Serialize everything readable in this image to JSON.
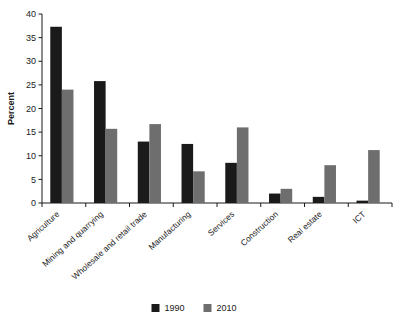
{
  "chart_data": {
    "type": "bar",
    "title": "",
    "xlabel": "",
    "ylabel": "Percent",
    "ylim": [
      0,
      40
    ],
    "yticks": [
      0,
      5,
      10,
      15,
      20,
      25,
      30,
      35,
      40
    ],
    "grid": false,
    "legend_position": "bottom-center",
    "categories": [
      "Agriculture",
      "Mining and quarrying",
      "Wholesale and retail trade",
      "Manufacturing",
      "Services",
      "Construction",
      "Real estate",
      "ICT"
    ],
    "series": [
      {
        "name": "1990",
        "color": "#1a1a1a",
        "values": [
          37.3,
          25.8,
          13.0,
          12.5,
          8.5,
          2.0,
          1.3,
          0.5
        ]
      },
      {
        "name": "2010",
        "color": "#6e6e6e",
        "values": [
          24.0,
          15.7,
          16.7,
          6.7,
          16.0,
          3.0,
          8.0,
          11.2
        ]
      }
    ]
  },
  "axis": {
    "y_title": "Percent",
    "tick_labels": [
      "0",
      "5",
      "10",
      "15",
      "20",
      "25",
      "30",
      "35",
      "40"
    ]
  },
  "legend": {
    "entries": [
      {
        "label": "1990",
        "color": "#1a1a1a"
      },
      {
        "label": "2010",
        "color": "#6e6e6e"
      }
    ]
  }
}
